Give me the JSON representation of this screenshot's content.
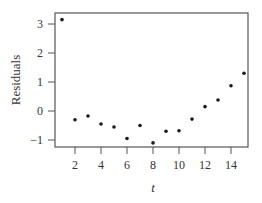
{
  "chart_data": {
    "type": "scatter",
    "title": "",
    "xlabel": "t",
    "ylabel": "Residuals",
    "xlim": [
      0.5,
      15.5
    ],
    "ylim": [
      -1.25,
      3.4
    ],
    "xticks": [
      2,
      4,
      6,
      8,
      10,
      12,
      14
    ],
    "yticks": [
      -1,
      0,
      1,
      2,
      3
    ],
    "grid": false,
    "legend": null,
    "series": [
      {
        "name": "Residuals",
        "x": [
          1,
          2,
          3,
          4,
          5,
          6,
          7,
          8,
          9,
          10,
          11,
          12,
          13,
          14,
          15
        ],
        "y": [
          3.15,
          -0.3,
          -0.17,
          -0.45,
          -0.55,
          -0.95,
          -0.5,
          -1.1,
          -0.7,
          -0.68,
          -0.28,
          0.15,
          0.38,
          0.87,
          1.3
        ]
      }
    ],
    "colors": {
      "points": "#1a1a1a",
      "axis": "#555555"
    }
  },
  "labels": {
    "xlabel": "t",
    "ylabel": "Residuals"
  }
}
